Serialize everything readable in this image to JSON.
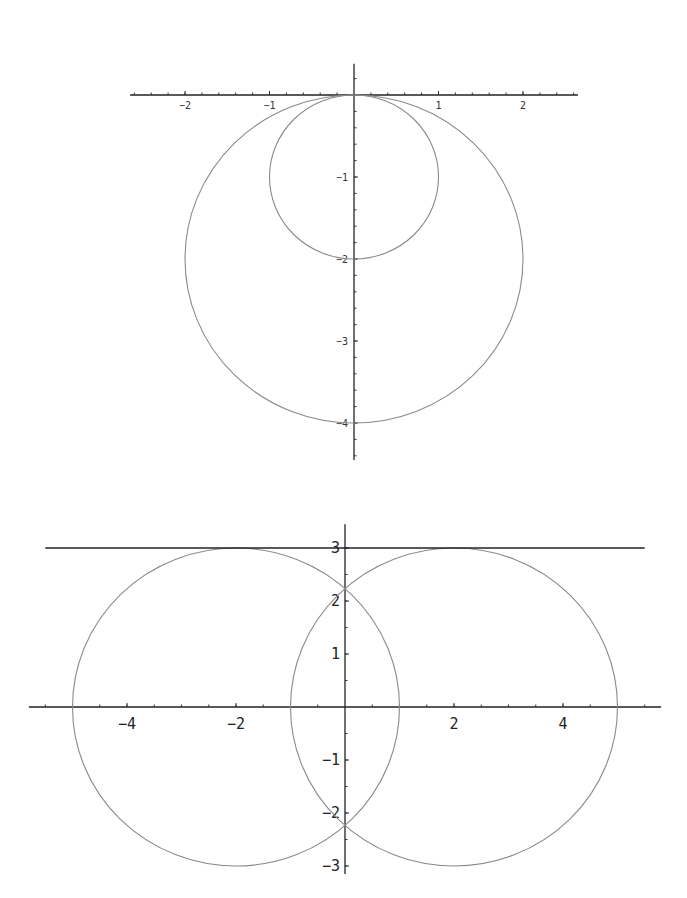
{
  "chart_data": [
    {
      "type": "line",
      "title": "",
      "xlabel": "",
      "ylabel": "",
      "xlim": [
        -2.65,
        2.65
      ],
      "ylim": [
        -4.45,
        0.38
      ],
      "grid": false,
      "xticks": [
        {
          "value": -2,
          "label": "-2"
        },
        {
          "value": -1,
          "label": "-1"
        },
        {
          "value": 1,
          "label": "1"
        },
        {
          "value": 2,
          "label": "2"
        }
      ],
      "yticks": [
        {
          "value": -1,
          "label": "-1"
        },
        {
          "value": -2,
          "label": "-2"
        },
        {
          "value": -3,
          "label": "-3"
        },
        {
          "value": -4,
          "label": "-4"
        }
      ],
      "minor_tick_step": 0.2,
      "series": [
        {
          "name": "circle-large",
          "shape": "circle",
          "center": [
            0,
            -2
          ],
          "radius": 2
        },
        {
          "name": "circle-small",
          "shape": "circle",
          "center": [
            0,
            -1
          ],
          "radius": 1
        }
      ]
    },
    {
      "type": "line",
      "title": "",
      "xlabel": "",
      "ylabel": "",
      "xlim": [
        -5.8,
        5.8
      ],
      "ylim": [
        -3.15,
        3.45
      ],
      "grid": false,
      "xticks": [
        {
          "value": -4,
          "label": "-4"
        },
        {
          "value": -2,
          "label": "-2"
        },
        {
          "value": 2,
          "label": "2"
        },
        {
          "value": 4,
          "label": "4"
        }
      ],
      "yticks": [
        {
          "value": 3,
          "label": "3"
        },
        {
          "value": 2,
          "label": "2"
        },
        {
          "value": 1,
          "label": "1"
        },
        {
          "value": -1,
          "label": "-1"
        },
        {
          "value": -2,
          "label": "-2"
        },
        {
          "value": -3,
          "label": "-3"
        }
      ],
      "minor_tick_step": 0.5,
      "series": [
        {
          "name": "circle-left",
          "shape": "circle",
          "center": [
            -2,
            0
          ],
          "radius": 3
        },
        {
          "name": "circle-right",
          "shape": "circle",
          "center": [
            2,
            0
          ],
          "radius": 3
        },
        {
          "name": "line-y3",
          "shape": "hline",
          "y": 3,
          "x_range": [
            -5.5,
            5.5
          ]
        }
      ]
    }
  ]
}
